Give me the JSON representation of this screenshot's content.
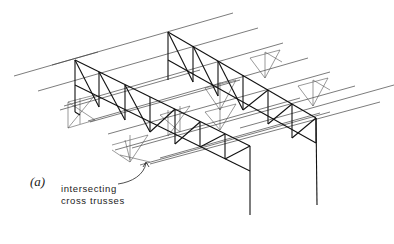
{
  "figure_label": "(a)",
  "annotation": {
    "line1": "intersecting",
    "line2": "cross trusses"
  },
  "colors": {
    "ink": "#1a1a1a",
    "light_ink": "#555555",
    "background": "#ffffff"
  }
}
